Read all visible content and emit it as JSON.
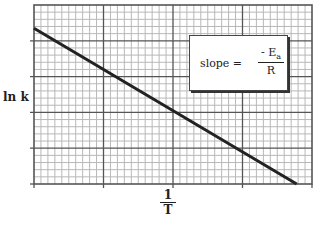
{
  "chart_data": {
    "type": "line",
    "title": "",
    "xlabel": "1/T",
    "ylabel": "ln k",
    "xlabel_numerator": "1",
    "xlabel_denominator": "T",
    "grid": true,
    "grid_style": "graph paper (major + minor gridlines)",
    "x_major_divisions": 4,
    "x_minor_per_major": 10,
    "y_major_divisions": 5,
    "y_minor_per_major": 5,
    "tick_labels": {
      "x": [],
      "y": []
    },
    "xlim": [
      0,
      4
    ],
    "ylim": [
      0,
      5
    ],
    "series": [
      {
        "name": "ln k vs 1/T",
        "x": [
          0,
          3.78
        ],
        "y": [
          4.35,
          0
        ],
        "color": "#222222",
        "style": "solid straight line, negative slope"
      }
    ],
    "annotations": [
      {
        "text": "slope = - Ea / R",
        "lhs": "slope =",
        "numerator": "- E",
        "numerator_subscript": "a",
        "denominator": "R",
        "position": "upper right, boxed"
      }
    ],
    "legend": null
  },
  "colors": {
    "line": "#222222",
    "major_grid": "#555555",
    "minor_grid": "#b8b8b8",
    "background": "#ffffff"
  }
}
